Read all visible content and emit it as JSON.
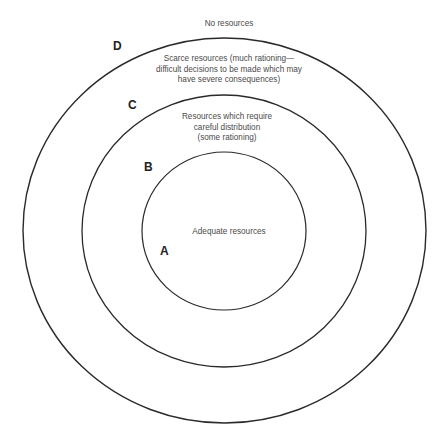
{
  "diagram": {
    "type": "concentric-circles",
    "zones": [
      {
        "letter": "A",
        "lines": [
          "Adequate resources"
        ]
      },
      {
        "letter": "B",
        "lines": [
          "Resources which require",
          "careful distribution",
          "(some rationing)"
        ]
      },
      {
        "letter": "C",
        "lines": [
          "Scarce resources (much rationing—",
          "difficult decisions to be made which may",
          "have severe consequences)"
        ]
      },
      {
        "letter": "D",
        "lines": [
          "No resources"
        ]
      }
    ],
    "stroke_color": "#2a2a2a"
  }
}
